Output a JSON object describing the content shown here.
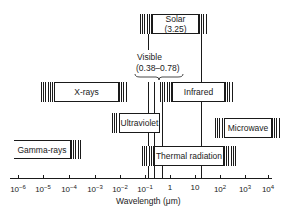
{
  "diagram": {
    "axis": {
      "label": "Wavelength (μm)",
      "ticks": [
        {
          "base": "10",
          "exp": "−6",
          "x": 18
        },
        {
          "base": "10",
          "exp": "−5",
          "x": 43
        },
        {
          "base": "10",
          "exp": "−4",
          "x": 69
        },
        {
          "base": "10",
          "exp": "−3",
          "x": 95
        },
        {
          "base": "10",
          "exp": "−2",
          "x": 120
        },
        {
          "base": "10",
          "exp": "−1",
          "x": 145
        },
        {
          "base": "1",
          "exp": "",
          "x": 170
        },
        {
          "base": "10",
          "exp": "",
          "x": 195
        },
        {
          "base": "10",
          "exp": "2",
          "x": 220
        },
        {
          "base": "10",
          "exp": "3",
          "x": 245
        },
        {
          "base": "10",
          "exp": "4",
          "x": 268
        }
      ]
    },
    "bands": {
      "solar": {
        "label": "Solar",
        "sublabel": "(3.25)"
      },
      "visible": {
        "label": "Visible",
        "sublabel": "(0.38–0.78)"
      },
      "xrays": {
        "label": "X-rays"
      },
      "infrared": {
        "label": "Infrared"
      },
      "ultraviolet": {
        "label": "Ultraviolet"
      },
      "microwave": {
        "label": "Microwave"
      },
      "gamma": {
        "label": "Gamma-rays"
      },
      "thermal": {
        "label": "Thermal radiation"
      }
    },
    "colors": {
      "ink": "#1a1a1a",
      "background": "#ffffff"
    }
  }
}
